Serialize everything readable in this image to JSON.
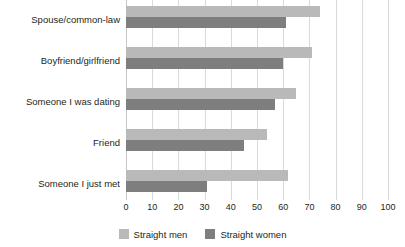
{
  "chart_data": {
    "type": "bar",
    "orientation": "horizontal",
    "title": "",
    "subtitle": "",
    "xlabel": "",
    "ylabel": "",
    "xlim": [
      0,
      100
    ],
    "xticks": [
      "0",
      "10",
      "20",
      "30",
      "40",
      "50",
      "60",
      "70",
      "80",
      "90",
      "100"
    ],
    "grid": "vertical",
    "legend_position": "bottom-center",
    "categories": [
      "Spouse/common-law",
      "Boyfriend/girlfriend",
      "Someone I was dating",
      "Friend",
      "Someone I just met"
    ],
    "series": [
      {
        "name": "Straight men",
        "color": "#b9b9b9",
        "values": [
          74,
          71,
          65,
          54,
          62
        ]
      },
      {
        "name": "Straight women",
        "color": "#7e7e7e",
        "values": [
          61,
          60,
          57,
          45,
          31
        ]
      }
    ]
  }
}
